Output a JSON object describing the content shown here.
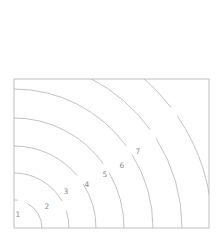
{
  "figure": {
    "background_color": "#ffffff",
    "width": 221,
    "height": 235
  },
  "axes": {
    "frame_color": "#b0b0b0",
    "frame_linewidth": 0.8,
    "left": 14,
    "top": 79,
    "right": 209,
    "bottom": 228,
    "xlim": [
      0,
      195
    ],
    "ylim": [
      0,
      149
    ],
    "xticks_visible": false,
    "yticks_visible": false,
    "xticklabels": [],
    "yticklabels": [],
    "grid": false
  },
  "chart_data": {
    "type": "line",
    "title": "",
    "xlabel": "",
    "ylabel": "",
    "contour_color": "#a8a8a8",
    "contour_linewidth": 0.7,
    "label_color": "#8c8c8c",
    "center": {
      "x": 14,
      "y": 228
    },
    "levels": [
      1,
      2,
      3,
      4,
      5,
      6,
      7
    ],
    "radii": [
      28,
      55,
      82,
      110,
      139,
      168,
      198
    ],
    "contours": [
      {
        "level": 1,
        "label": "1",
        "radius": 28,
        "label_x": 18,
        "label_y": 215,
        "label_angle": 72
      },
      {
        "level": 2,
        "label": "2",
        "radius": 55,
        "label_x": 47,
        "label_y": 207,
        "label_angle": 24
      },
      {
        "level": 3,
        "label": "3",
        "radius": 82,
        "label_x": 66,
        "label_y": 192,
        "label_angle": 36
      },
      {
        "level": 4,
        "label": "4",
        "radius": 110,
        "label_x": 87,
        "label_y": 185,
        "label_angle": 33
      },
      {
        "level": 5,
        "label": "5",
        "radius": 139,
        "label_x": 105,
        "label_y": 175,
        "label_angle": 34
      },
      {
        "level": 6,
        "label": "6",
        "radius": 168,
        "label_x": 122,
        "label_y": 166,
        "label_angle": 34
      },
      {
        "level": 7,
        "label": "7",
        "radius": 198,
        "label_x": 138,
        "label_y": 152,
        "label_angle": 36
      }
    ]
  }
}
